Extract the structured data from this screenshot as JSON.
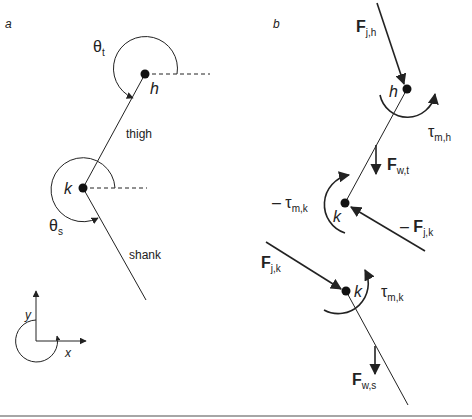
{
  "panel_a": {
    "label": "a",
    "theta_t": {
      "symbol": "θ",
      "sub": "t"
    },
    "theta_s": {
      "symbol": "θ",
      "sub": "s"
    },
    "hip_label": "h",
    "knee_label": "k",
    "thigh_label": "thigh",
    "shank_label": "shank",
    "axes": {
      "x_label": "x",
      "y_label": "y"
    }
  },
  "panel_b": {
    "label": "b",
    "hip_label": "h",
    "knee_upper_label": "k",
    "knee_lower_label": "k",
    "F_jh": {
      "main": "F",
      "sub": "j,h"
    },
    "tau_mh": {
      "main": "τ",
      "sub": "m,h"
    },
    "F_wt": {
      "main": "F",
      "sub": "w,t"
    },
    "neg_tau_mk": {
      "prefix": "– ",
      "main": "τ",
      "sub": "m,k"
    },
    "neg_F_jk": {
      "prefix": "– ",
      "main": "F",
      "sub": "j,k"
    },
    "F_jk": {
      "main": "F",
      "sub": "j,k"
    },
    "tau_mk": {
      "main": "τ",
      "sub": "m,k"
    },
    "F_ws": {
      "main": "F",
      "sub": "w,s"
    }
  },
  "colors": {
    "line": "#222222",
    "rule": "#888888",
    "text": "#222222"
  }
}
